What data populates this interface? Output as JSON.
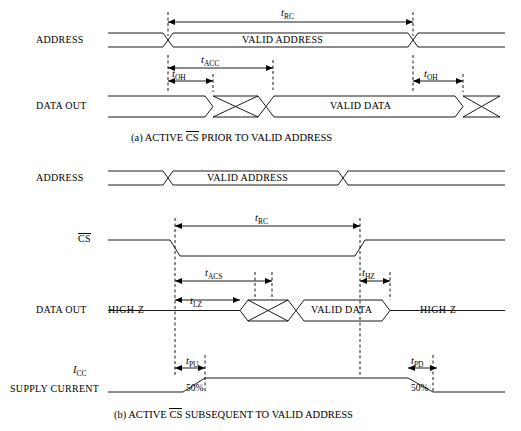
{
  "diagram": {
    "signals": {
      "address_1": "ADDRESS",
      "data_out_1": "DATA OUT",
      "address_2": "ADDRESS",
      "cs": "CS",
      "data_out_2": "DATA OUT",
      "icc": "I",
      "icc_sub": "CC",
      "supply_current": "SUPPLY CURRENT"
    },
    "values": {
      "valid_address_1": "VALID ADDRESS",
      "valid_data_1": "VALID DATA",
      "valid_address_2": "VALID ADDRESS",
      "valid_data_2": "VALID DATA",
      "high_z_left": "HIGH-Z",
      "high_z_right": "HIGH-Z",
      "pct_left": "50%",
      "pct_right": "50%"
    },
    "timings": {
      "trc_a": {
        "base": "t",
        "sub": "RC"
      },
      "tacc": {
        "base": "t",
        "sub": "ACC"
      },
      "toh_left": {
        "base": "t",
        "sub": "OH"
      },
      "toh_right": {
        "base": "t",
        "sub": "OH"
      },
      "trc_b": {
        "base": "t",
        "sub": "RC"
      },
      "tacs": {
        "base": "t",
        "sub": "ACS"
      },
      "thz": {
        "base": "t",
        "sub": "HZ"
      },
      "tlz": {
        "base": "t",
        "sub": "LZ"
      },
      "tpu": {
        "base": "t",
        "sub": "PU"
      },
      "tpd": {
        "base": "t",
        "sub": "PD"
      }
    },
    "captions": {
      "a_prefix": "(a) ACTIVE ",
      "a_overline": "CS",
      "a_suffix": " PRIOR TO VALID ADDRESS",
      "b_prefix": "(b) ACTIVE ",
      "b_overline": "CS",
      "b_suffix": " SUBSEQUENT TO VALID ADDRESS"
    },
    "colors": {
      "line": "#000000",
      "background": "#ffffff"
    }
  }
}
